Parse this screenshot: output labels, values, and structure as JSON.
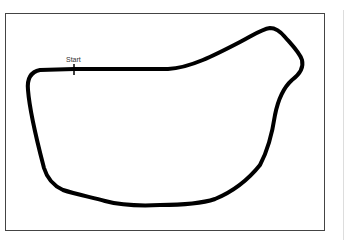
{
  "diagram": {
    "type": "race-track-layout",
    "start_label": "Start",
    "track_color": "#000000",
    "frame_color": "#444444",
    "background": "#ffffff"
  }
}
